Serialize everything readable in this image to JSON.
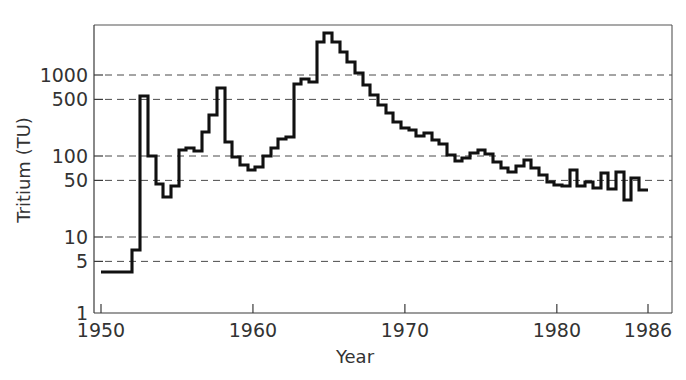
{
  "chart_data": {
    "type": "line",
    "title": "",
    "subtitle": "",
    "xlabel": "Year",
    "ylabel": "Tritium (TU)",
    "yscale": "log",
    "xscale": "linear",
    "xlim": [
      1950,
      1986
    ],
    "ylim": [
      1,
      3000
    ],
    "grid": "horizontal-dashed",
    "legend": "none",
    "step_style": "post",
    "annotations": [],
    "xticks": [
      {
        "value": 1950,
        "label": "1950"
      },
      {
        "value": 1960,
        "label": "1960"
      },
      {
        "value": 1970,
        "label": "1970"
      },
      {
        "value": 1980,
        "label": "1980"
      },
      {
        "value": 1986,
        "label": "1986"
      }
    ],
    "yticks": [
      {
        "value": 1000,
        "label": "1000",
        "grid": true
      },
      {
        "value": 500,
        "label": "500",
        "grid": true
      },
      {
        "value": 100,
        "label": "100",
        "grid": true
      },
      {
        "value": 50,
        "label": "50",
        "grid": true
      },
      {
        "value": 10,
        "label": "10",
        "grid": true
      },
      {
        "value": 5,
        "label": "5",
        "grid": true
      },
      {
        "value": 1,
        "label": "1",
        "grid": false
      }
    ],
    "series": [
      {
        "name": "Tritium in precipitation",
        "color": "#111111",
        "x": [
          1950,
          1951,
          1952,
          1953,
          1954,
          1955,
          1956,
          1957,
          1958,
          1959,
          1960,
          1961,
          1962,
          1963,
          1964,
          1965,
          1966,
          1967,
          1968,
          1969,
          1970,
          1971,
          1972,
          1973,
          1974,
          1975,
          1976,
          1977,
          1978,
          1979,
          1980,
          1981,
          1982,
          1983,
          1984,
          1985,
          1986
        ],
        "values": [
          3,
          3,
          6,
          35,
          550,
          100,
          60,
          40,
          130,
          160,
          125,
          300,
          250,
          190,
          160,
          165,
          185,
          240,
          420,
          780,
          560,
          1050,
          1000,
          2500,
          2050,
          1700,
          1400,
          1150,
          900,
          700,
          560,
          430,
          340,
          310,
          290,
          260,
          230
        ],
        "values_note": "step-post series read off log axis"
      }
    ],
    "data_points": [
      {
        "year": 1950,
        "tu": 3
      },
      {
        "year": 1951,
        "tu": 3
      },
      {
        "year": 1952,
        "tu": 6
      },
      {
        "year": 1953,
        "tu": 35
      },
      {
        "year": 1954,
        "tu": 550
      },
      {
        "year": 1955,
        "tu": 100
      },
      {
        "year": 1956,
        "tu": 60
      },
      {
        "year": 1957,
        "tu": 40
      },
      {
        "year": 1958,
        "tu": 130
      },
      {
        "year": 1959,
        "tu": 160
      },
      {
        "year": 1960,
        "tu": 125
      },
      {
        "year": 1961,
        "tu": 300
      },
      {
        "year": 1962,
        "tu": 850
      },
      {
        "year": 1963,
        "tu": 2500
      },
      {
        "year": 1964,
        "tu": 1500
      },
      {
        "year": 1965,
        "tu": 900
      },
      {
        "year": 1966,
        "tu": 500
      },
      {
        "year": 1967,
        "tu": 330
      },
      {
        "year": 1968,
        "tu": 260
      },
      {
        "year": 1969,
        "tu": 220
      },
      {
        "year": 1970,
        "tu": 160
      },
      {
        "year": 1971,
        "tu": 130
      },
      {
        "year": 1972,
        "tu": 110
      },
      {
        "year": 1973,
        "tu": 120
      },
      {
        "year": 1974,
        "tu": 105
      },
      {
        "year": 1975,
        "tu": 85
      },
      {
        "year": 1976,
        "tu": 95
      },
      {
        "year": 1977,
        "tu": 72
      },
      {
        "year": 1978,
        "tu": 60
      },
      {
        "year": 1979,
        "tu": 52
      },
      {
        "year": 1980,
        "tu": 45
      },
      {
        "year": 1981,
        "tu": 62
      },
      {
        "year": 1982,
        "tu": 48
      },
      {
        "year": 1983,
        "tu": 58
      },
      {
        "year": 1984,
        "tu": 40
      },
      {
        "year": 1985,
        "tu": 38
      },
      {
        "year": 1986,
        "tu": 38
      }
    ],
    "polyline_points": [
      [
        101,
        272
      ],
      [
        132,
        272
      ],
      [
        132,
        250
      ],
      [
        140,
        250
      ],
      [
        140,
        96
      ],
      [
        148,
        96
      ],
      [
        148,
        156
      ],
      [
        156,
        156
      ],
      [
        156,
        184
      ],
      [
        163,
        184
      ],
      [
        163,
        197
      ],
      [
        171,
        197
      ],
      [
        171,
        186
      ],
      [
        179,
        186
      ],
      [
        179,
        150
      ],
      [
        186,
        150
      ],
      [
        186,
        148
      ],
      [
        194,
        148
      ],
      [
        194,
        151
      ],
      [
        202,
        151
      ],
      [
        202,
        132
      ],
      [
        209,
        132
      ],
      [
        209,
        115
      ],
      [
        217,
        115
      ],
      [
        217,
        88
      ],
      [
        225,
        88
      ],
      [
        225,
        142
      ],
      [
        232,
        142
      ],
      [
        232,
        157
      ],
      [
        240,
        157
      ],
      [
        240,
        165
      ],
      [
        248,
        165
      ],
      [
        248,
        170
      ],
      [
        255,
        170
      ],
      [
        255,
        167
      ],
      [
        263,
        167
      ],
      [
        263,
        156
      ],
      [
        271,
        156
      ],
      [
        271,
        148
      ],
      [
        278,
        148
      ],
      [
        278,
        139
      ],
      [
        286,
        139
      ],
      [
        286,
        137
      ],
      [
        294,
        137
      ],
      [
        294,
        84
      ],
      [
        301,
        84
      ],
      [
        301,
        79
      ],
      [
        309,
        79
      ],
      [
        309,
        82
      ],
      [
        317,
        82
      ],
      [
        317,
        42
      ],
      [
        324,
        42
      ],
      [
        324,
        33
      ],
      [
        332,
        33
      ],
      [
        332,
        42
      ],
      [
        340,
        42
      ],
      [
        340,
        52
      ],
      [
        347,
        52
      ],
      [
        347,
        62
      ],
      [
        355,
        62
      ],
      [
        355,
        73
      ],
      [
        363,
        73
      ],
      [
        363,
        85
      ],
      [
        370,
        85
      ],
      [
        370,
        95
      ],
      [
        378,
        95
      ],
      [
        378,
        105
      ],
      [
        386,
        105
      ],
      [
        386,
        113
      ],
      [
        393,
        113
      ],
      [
        393,
        122
      ],
      [
        401,
        122
      ],
      [
        401,
        128
      ],
      [
        409,
        128
      ],
      [
        409,
        130
      ],
      [
        416,
        130
      ],
      [
        416,
        136
      ],
      [
        424,
        136
      ],
      [
        424,
        133
      ],
      [
        432,
        133
      ],
      [
        432,
        140
      ],
      [
        439,
        140
      ],
      [
        439,
        144
      ],
      [
        447,
        144
      ],
      [
        447,
        155
      ],
      [
        455,
        155
      ],
      [
        455,
        161
      ],
      [
        462,
        161
      ],
      [
        462,
        158
      ],
      [
        470,
        158
      ],
      [
        470,
        153
      ],
      [
        478,
        153
      ],
      [
        478,
        150
      ],
      [
        485,
        150
      ],
      [
        485,
        154
      ],
      [
        493,
        154
      ],
      [
        493,
        162
      ],
      [
        501,
        162
      ],
      [
        501,
        168
      ],
      [
        508,
        168
      ],
      [
        508,
        172
      ],
      [
        516,
        172
      ],
      [
        516,
        166
      ],
      [
        524,
        166
      ],
      [
        524,
        160
      ],
      [
        531,
        160
      ],
      [
        531,
        168
      ],
      [
        539,
        168
      ],
      [
        539,
        175
      ],
      [
        547,
        175
      ],
      [
        547,
        182
      ],
      [
        554,
        182
      ],
      [
        554,
        185
      ],
      [
        562,
        185
      ],
      [
        562,
        186
      ],
      [
        570,
        186
      ],
      [
        570,
        170
      ],
      [
        577,
        170
      ],
      [
        577,
        186
      ],
      [
        585,
        186
      ],
      [
        585,
        182
      ],
      [
        593,
        182
      ],
      [
        593,
        188
      ],
      [
        601,
        188
      ],
      [
        601,
        173
      ],
      [
        608,
        173
      ],
      [
        608,
        189
      ],
      [
        616,
        189
      ],
      [
        616,
        172
      ],
      [
        624,
        172
      ],
      [
        624,
        200
      ],
      [
        631,
        200
      ],
      [
        631,
        178
      ],
      [
        639,
        178
      ],
      [
        639,
        190
      ],
      [
        648,
        190
      ]
    ]
  },
  "axes": {
    "y_title": "Tritium (TU)",
    "x_title": "Year"
  },
  "figure": {
    "background_color": "#ffffff",
    "line_color": "#111111",
    "grid_color": "#4a4a4a",
    "text_color": "#333333"
  }
}
